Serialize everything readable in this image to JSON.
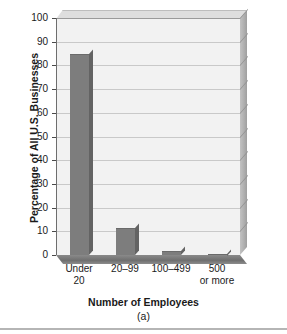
{
  "chart_data": {
    "type": "bar",
    "title": "",
    "categories": [
      "Under 20",
      "20–99",
      "100–499",
      "500 or more"
    ],
    "category_lines": [
      [
        "Under",
        "20"
      ],
      [
        "20–99",
        ""
      ],
      [
        "100–499",
        ""
      ],
      [
        "500",
        "or more"
      ]
    ],
    "values": [
      85,
      11.5,
      1.5,
      0.3
    ],
    "xlabel": "Number of Employees",
    "ylabel": "Percentage of All U.S. Businesses",
    "ylim": [
      0,
      100
    ],
    "yticks": [
      0,
      10,
      20,
      30,
      40,
      50,
      60,
      70,
      80,
      90,
      100
    ],
    "ytick_labels": [
      "0",
      "10",
      "20",
      "30",
      "40",
      "50",
      "60",
      "70",
      "80",
      "90",
      "100"
    ],
    "grid": true,
    "legend": false,
    "style": "3d",
    "bar_color": "#7d7d7d",
    "plot_bg_color": "#f2f2f2",
    "gridline_color": "#c9c9c9"
  },
  "figure": {
    "caption": "(a)"
  },
  "bleed_through": {
    "line1": "PERSENDUEB STAAR",
    "line2": "ES in SUCIETY"
  }
}
